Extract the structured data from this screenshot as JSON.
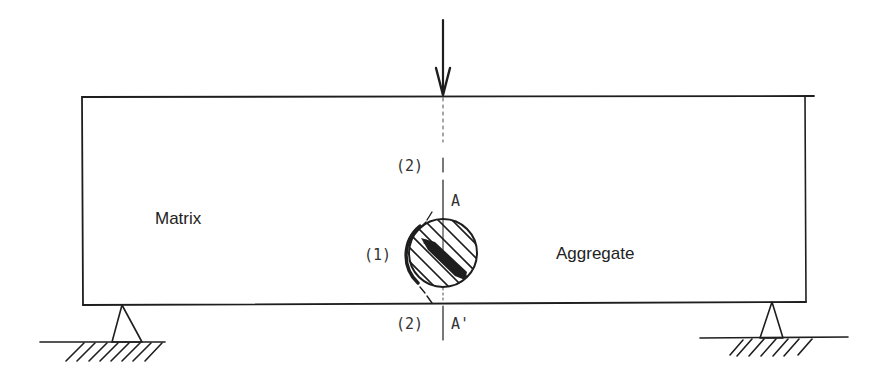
{
  "diagram": {
    "title": "",
    "labels": {
      "matrix": "Matrix",
      "aggregate": "Aggregate",
      "crack_interface": "(1)",
      "crack_top": "(2)",
      "crack_bottom": "(2)",
      "section_top": "A",
      "section_bottom": "A'"
    },
    "elements": {
      "load": "point-load-arrow",
      "beam": "beam-rectangle",
      "inclusion": "hatched-circular-aggregate",
      "supports": [
        "left-pin-support",
        "right-pin-support"
      ],
      "centerline": "dashed-section-line A-A'"
    },
    "colors": {
      "ink": "#1e1e1e",
      "background": "#ffffff"
    }
  }
}
